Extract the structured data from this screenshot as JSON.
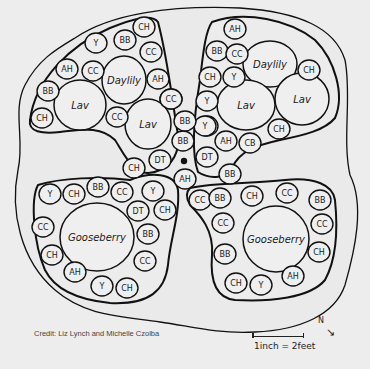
{
  "diagram": {
    "credit": "Credit: Liz Lynch and Michelle Czolba",
    "scale": "1inch = 2feet",
    "north_label": "N",
    "north_arrow": "→",
    "center_marker": "•",
    "beds": {
      "top_left": {
        "large": [
          {
            "label": "Daylily",
            "x": 124,
            "y": 80,
            "rx": 22,
            "ry": 24
          },
          {
            "label": "Lav",
            "x": 80,
            "y": 105,
            "rx": 26,
            "ry": 25
          },
          {
            "label": "Lav",
            "x": 148,
            "y": 124,
            "rx": 23,
            "ry": 25
          }
        ],
        "small": [
          {
            "label": "CH",
            "x": 144,
            "y": 27
          },
          {
            "label": "Y",
            "x": 96,
            "y": 43
          },
          {
            "label": "BB",
            "x": 125,
            "y": 40
          },
          {
            "label": "CC",
            "x": 151,
            "y": 52
          },
          {
            "label": "AH",
            "x": 67,
            "y": 69
          },
          {
            "label": "CC",
            "x": 93,
            "y": 71
          },
          {
            "label": "AH",
            "x": 158,
            "y": 79
          },
          {
            "label": "BB",
            "x": 48,
            "y": 91
          },
          {
            "label": "CC",
            "x": 171,
            "y": 99
          },
          {
            "label": "CH",
            "x": 42,
            "y": 118
          },
          {
            "label": "CC",
            "x": 117,
            "y": 117
          }
        ]
      },
      "top_right": {
        "large": [
          {
            "label": "Daylily",
            "x": 270,
            "y": 64,
            "rx": 27,
            "ry": 23
          },
          {
            "label": "Lav",
            "x": 246,
            "y": 105,
            "rx": 29,
            "ry": 25
          },
          {
            "label": "Lav",
            "x": 302,
            "y": 99,
            "rx": 27,
            "ry": 26
          }
        ],
        "small": [
          {
            "label": "AH",
            "x": 235,
            "y": 29
          },
          {
            "label": "BB",
            "x": 217,
            "y": 51
          },
          {
            "label": "CC",
            "x": 237,
            "y": 54
          },
          {
            "label": "CH",
            "x": 309,
            "y": 70
          },
          {
            "label": "CH",
            "x": 210,
            "y": 77
          },
          {
            "label": "Y",
            "x": 234,
            "y": 77
          },
          {
            "label": "Y",
            "x": 207,
            "y": 101
          },
          {
            "label": "Y",
            "x": 207,
            "y": 126
          },
          {
            "label": "AH",
            "x": 226,
            "y": 141
          },
          {
            "label": "CB",
            "x": 250,
            "y": 143
          },
          {
            "label": "CH",
            "x": 279,
            "y": 129
          }
        ]
      },
      "center": {
        "small": [
          {
            "label": "CC",
            "x": 171,
            "y": 99
          },
          {
            "label": "BB",
            "x": 183,
            "y": 141
          },
          {
            "label": "Y",
            "x": 205,
            "y": 126
          },
          {
            "label": "DT",
            "x": 160,
            "y": 160
          },
          {
            "label": "DT",
            "x": 207,
            "y": 157
          },
          {
            "label": "AH",
            "x": 185,
            "y": 179
          },
          {
            "label": "CH",
            "x": 134,
            "y": 168
          },
          {
            "label": "BB",
            "x": 230,
            "y": 174
          },
          {
            "label": "BB",
            "x": 185,
            "y": 121
          }
        ]
      },
      "bottom_left": {
        "large": [
          {
            "label": "Gooseberry",
            "x": 97,
            "y": 237,
            "rx": 37,
            "ry": 34
          }
        ],
        "small": [
          {
            "label": "Y",
            "x": 50,
            "y": 194
          },
          {
            "label": "CH",
            "x": 74,
            "y": 194
          },
          {
            "label": "BB",
            "x": 98,
            "y": 187
          },
          {
            "label": "CC",
            "x": 122,
            "y": 192
          },
          {
            "label": "Y",
            "x": 153,
            "y": 191
          },
          {
            "label": "CC",
            "x": 43,
            "y": 227
          },
          {
            "label": "DT",
            "x": 138,
            "y": 211
          },
          {
            "label": "CH",
            "x": 165,
            "y": 210
          },
          {
            "label": "BB",
            "x": 148,
            "y": 234
          },
          {
            "label": "CH",
            "x": 52,
            "y": 255
          },
          {
            "label": "CC",
            "x": 145,
            "y": 261
          },
          {
            "label": "AH",
            "x": 75,
            "y": 272
          },
          {
            "label": "Y",
            "x": 102,
            "y": 286
          },
          {
            "label": "CH",
            "x": 127,
            "y": 288
          }
        ]
      },
      "bottom_right": {
        "large": [
          {
            "label": "Gooseberry",
            "x": 276,
            "y": 239,
            "rx": 33,
            "ry": 33
          }
        ],
        "small": [
          {
            "label": "CC",
            "x": 200,
            "y": 200
          },
          {
            "label": "BB",
            "x": 220,
            "y": 198
          },
          {
            "label": "CH",
            "x": 252,
            "y": 196
          },
          {
            "label": "CC",
            "x": 287,
            "y": 193
          },
          {
            "label": "BB",
            "x": 320,
            "y": 200
          },
          {
            "label": "CC",
            "x": 223,
            "y": 223
          },
          {
            "label": "CC",
            "x": 322,
            "y": 224
          },
          {
            "label": "BB",
            "x": 225,
            "y": 254
          },
          {
            "label": "CH",
            "x": 319,
            "y": 252
          },
          {
            "label": "AH",
            "x": 293,
            "y": 276
          },
          {
            "label": "CH",
            "x": 236,
            "y": 283
          },
          {
            "label": "Y",
            "x": 261,
            "y": 285
          }
        ]
      }
    }
  }
}
